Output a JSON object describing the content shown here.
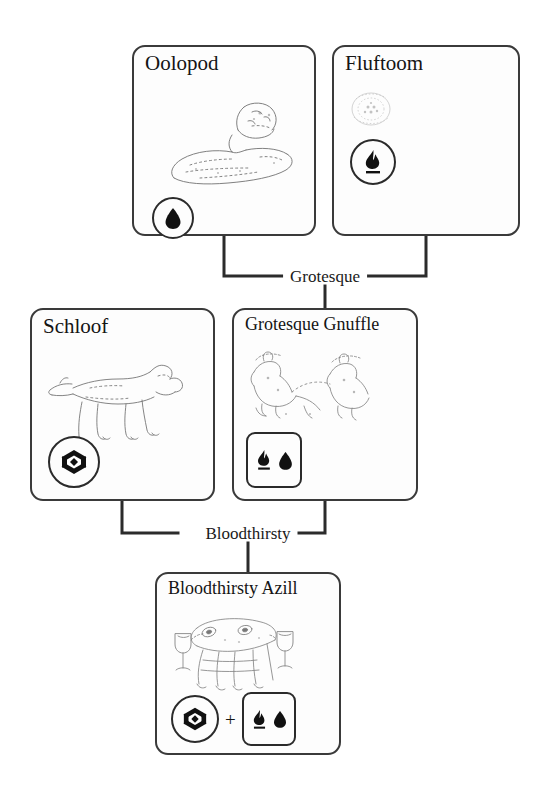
{
  "diagram": {
    "type": "breeding-lineage-tree",
    "title_visible": false,
    "background_color": "#ffffff",
    "line_color": "#2b2b2b",
    "card_border_color": "#3a3a3a"
  },
  "cards": [
    {
      "id": "oolopod",
      "name": "Oolopod",
      "row": "top",
      "creature_art": "seated-furry-creature-sketch",
      "badges": [
        {
          "shape": "circle",
          "icons": [
            "water-droplet-icon"
          ]
        }
      ]
    },
    {
      "id": "fluftoom",
      "name": "Fluftoom",
      "row": "top",
      "creature_art": "small-faint-round-creature-sketch",
      "badges": [
        {
          "shape": "circle",
          "icons": [
            "flame-underlined-icon"
          ]
        }
      ]
    },
    {
      "id": "schloof",
      "name": "Schloof",
      "row": "middle",
      "creature_art": "horse-like-creature-sketch",
      "badges": [
        {
          "shape": "circle",
          "icons": [
            "gem-crystal-icon"
          ]
        }
      ]
    },
    {
      "id": "grotesque-gnuffle",
      "name": "Grotesque Gnuffle",
      "row": "middle",
      "creature_art": "two-seated-creatures-sketch",
      "badges": [
        {
          "shape": "rounded-square",
          "icons": [
            "flame-underlined-icon",
            "water-droplet-icon"
          ]
        }
      ]
    },
    {
      "id": "bloodthirsty-azill",
      "name": "Bloodthirsty Azill",
      "row": "bottom",
      "creature_art": "long-legged-creature-with-goblets-sketch",
      "badges": [
        {
          "shape": "circle",
          "icons": [
            "gem-crystal-icon"
          ]
        },
        {
          "shape": "rounded-square",
          "icons": [
            "flame-underlined-icon",
            "water-droplet-icon"
          ]
        }
      ],
      "badge_separator": "+"
    }
  ],
  "connections": [
    {
      "id": "grotesque-edge",
      "label": "Grotesque",
      "parents": [
        "oolopod",
        "fluftoom"
      ],
      "child": "grotesque-gnuffle"
    },
    {
      "id": "bloodthirsty-edge",
      "label": "Bloodthirsty",
      "parents": [
        "schloof",
        "grotesque-gnuffle"
      ],
      "child": "bloodthirsty-azill"
    }
  ],
  "separators": {
    "plus": "+"
  }
}
